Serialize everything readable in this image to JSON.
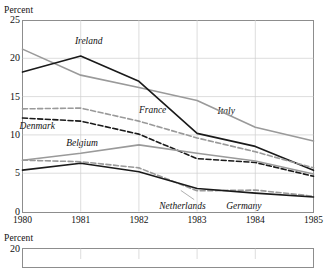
{
  "figure": {
    "axis_title_top": "Percent",
    "axis_title_bottom": "Percent"
  },
  "chart_data": {
    "type": "line",
    "title": "",
    "subtitle": "",
    "xlabel": "",
    "ylabel": "Percent",
    "x": [
      1980,
      1981,
      1982,
      1983,
      1984,
      1985
    ],
    "categories": [
      "1980",
      "1981",
      "1982",
      "1983",
      "1984",
      "1985"
    ],
    "xlim": [
      1980,
      1985
    ],
    "ylim": [
      0,
      25
    ],
    "yticks": [
      0,
      5,
      10,
      15,
      20,
      25
    ],
    "ytick_labels": [
      "0",
      "5",
      "10",
      "15",
      "20",
      "25"
    ],
    "xticks": [
      1980,
      1981,
      1982,
      1983,
      1984,
      1985
    ],
    "xtick_labels": [
      "1980",
      "1981",
      "1982",
      "1983",
      "1984",
      "1985"
    ],
    "grid": true,
    "grid_axis": "both",
    "legend": "inline-annotations",
    "legend_position": "inline",
    "series": [
      {
        "name": "Italy",
        "label": "Italy",
        "style": "solid",
        "color": "#9a9a9a",
        "values": [
          21.2,
          17.8,
          16.2,
          14.5,
          11.0,
          9.2
        ],
        "label_x": 1983.35,
        "label_y": 13.1
      },
      {
        "name": "Ireland",
        "label": "Ireland",
        "style": "solid",
        "color": "#1a1a1a",
        "values": [
          18.2,
          20.3,
          17.0,
          10.2,
          8.5,
          5.4
        ],
        "label_x": 1980.9,
        "label_y": 22.3
      },
      {
        "name": "France",
        "label": "France",
        "style": "dashed",
        "color": "#9a9a9a",
        "values": [
          13.4,
          13.5,
          11.8,
          9.6,
          7.8,
          5.7
        ],
        "label_x": 1982.0,
        "label_y": 13.2
      },
      {
        "name": "Denmark",
        "label": "Denmark",
        "style": "dashed",
        "color": "#1a1a1a",
        "values": [
          12.2,
          11.8,
          10.1,
          6.9,
          6.4,
          4.6
        ],
        "label_x": 1979.95,
        "label_y": 11.2
      },
      {
        "name": "Belgium",
        "label": "Belgium",
        "style": "solid",
        "color": "#9a9a9a",
        "values": [
          6.7,
          7.6,
          8.7,
          7.6,
          6.6,
          4.9
        ],
        "label_x": 1980.75,
        "label_y": 9.0
      },
      {
        "name": "Netherlands",
        "label": "Netherlands",
        "style": "dashed",
        "color": "#9a9a9a",
        "values": [
          6.7,
          6.5,
          5.7,
          2.7,
          2.8,
          2.0
        ],
        "label_x": 1982.35,
        "label_y": 0.75
      },
      {
        "name": "Germany",
        "label": "Germany",
        "style": "solid",
        "color": "#1a1a1a",
        "values": [
          5.4,
          6.3,
          5.2,
          3.0,
          2.4,
          1.9
        ],
        "label_x": 1983.5,
        "label_y": 0.75
      }
    ],
    "annotations": [
      {
        "name": "netherlands-leader-line",
        "from_x": 1982.95,
        "from_y": 1.55,
        "to_x": 1982.72,
        "to_y": 2.75
      }
    ]
  },
  "second_chart": {
    "axis_title": "Percent",
    "ytop_label": "20",
    "ylim": [
      0,
      20
    ],
    "note": "cropped at bottom edge of screenshot"
  }
}
